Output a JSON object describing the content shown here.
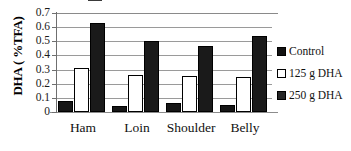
{
  "chart_data": {
    "type": "bar",
    "title": "",
    "xlabel": "",
    "ylabel": "DHA ( %TFA)",
    "categories": [
      "Ham",
      "Loin",
      "Shoulder",
      "Belly"
    ],
    "series": [
      {
        "name": "Control",
        "values": [
          0.08,
          0.045,
          0.065,
          0.05
        ],
        "color": "#161616",
        "fill": "solid-black"
      },
      {
        "name": "125 g DHA",
        "values": [
          0.31,
          0.265,
          0.255,
          0.25
        ],
        "color": "#ffffff",
        "fill": "white-outlined"
      },
      {
        "name": "250 g DHA",
        "values": [
          0.63,
          0.5,
          0.47,
          0.54
        ],
        "color": "#1a1a1a",
        "fill": "solid-black"
      }
    ],
    "ylim": [
      0,
      0.7
    ],
    "yticks": [
      0,
      0.1,
      0.2,
      0.3,
      0.4,
      0.5,
      0.6,
      0.7
    ],
    "ytick_labels": [
      "0",
      "0.1",
      "0.2",
      "0.3",
      "0.4",
      "0.5",
      "0.6",
      "0.7"
    ],
    "grid": "horizontal",
    "legend_position": "right"
  },
  "axis": {
    "y_title": "DHA ( %TFA)",
    "ticks": [
      {
        "value": 0.7,
        "label": "0.7"
      },
      {
        "value": 0.6,
        "label": "0.6"
      },
      {
        "value": 0.5,
        "label": "0.5"
      },
      {
        "value": 0.4,
        "label": "0.4"
      },
      {
        "value": 0.3,
        "label": "0.3"
      },
      {
        "value": 0.2,
        "label": "0.2"
      },
      {
        "value": 0.1,
        "label": "0.1"
      },
      {
        "value": 0.0,
        "label": "0"
      }
    ]
  },
  "legend": {
    "entries": [
      {
        "label": "Control"
      },
      {
        "label": "125 g DHA"
      },
      {
        "label": "250 g DHA"
      }
    ]
  }
}
